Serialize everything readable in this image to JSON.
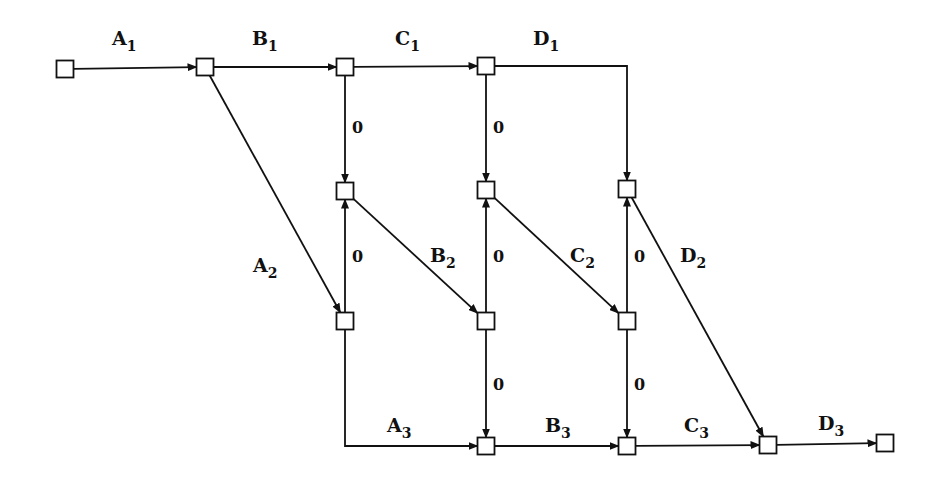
{
  "diagram": {
    "type": "activity-network",
    "node_size": 17,
    "stroke_color": "#111111",
    "background": "#ffffff",
    "nodes": [
      {
        "id": "n0",
        "x": 65,
        "y": 69
      },
      {
        "id": "n1",
        "x": 205,
        "y": 67
      },
      {
        "id": "n2",
        "x": 345,
        "y": 67
      },
      {
        "id": "n3",
        "x": 486,
        "y": 66
      },
      {
        "id": "m1",
        "x": 345,
        "y": 191
      },
      {
        "id": "m2",
        "x": 486,
        "y": 190
      },
      {
        "id": "m3",
        "x": 627,
        "y": 189
      },
      {
        "id": "l1",
        "x": 345,
        "y": 321
      },
      {
        "id": "l2",
        "x": 486,
        "y": 321
      },
      {
        "id": "l3",
        "x": 627,
        "y": 321
      },
      {
        "id": "b2",
        "x": 486,
        "y": 446
      },
      {
        "id": "b3",
        "x": 627,
        "y": 446
      },
      {
        "id": "b4",
        "x": 768,
        "y": 445
      },
      {
        "id": "b5",
        "x": 885,
        "y": 443
      }
    ],
    "edges": [
      {
        "from": "n0",
        "to": "n1",
        "label": "A",
        "sub": "1",
        "lx": 112,
        "ly": 45
      },
      {
        "from": "n1",
        "to": "n2",
        "label": "B",
        "sub": "1",
        "lx": 252,
        "ly": 45
      },
      {
        "from": "n2",
        "to": "n3",
        "label": "C",
        "sub": "1",
        "lx": 395,
        "ly": 45
      },
      {
        "from": "n3",
        "to": "m3",
        "label": "D",
        "sub": "1",
        "lx": 533,
        "ly": 45,
        "route": "elbow-right-down"
      },
      {
        "from": "n1",
        "to": "l1",
        "label": "A",
        "sub": "2",
        "lx": 253,
        "ly": 272
      },
      {
        "from": "m1",
        "to": "l2",
        "label": "B",
        "sub": "2",
        "lx": 430,
        "ly": 262
      },
      {
        "from": "m2",
        "to": "l3",
        "label": "C",
        "sub": "2",
        "lx": 570,
        "ly": 262
      },
      {
        "from": "m3",
        "to": "b4",
        "label": "D",
        "sub": "2",
        "lx": 680,
        "ly": 262
      },
      {
        "from": "l1",
        "to": "b2",
        "label": "A",
        "sub": "3",
        "lx": 387,
        "ly": 432,
        "route": "elbow-down-right"
      },
      {
        "from": "b2",
        "to": "b3",
        "label": "B",
        "sub": "3",
        "lx": 545,
        "ly": 432
      },
      {
        "from": "b3",
        "to": "b4",
        "label": "C",
        "sub": "3",
        "lx": 684,
        "ly": 432
      },
      {
        "from": "b4",
        "to": "b5",
        "label": "D",
        "sub": "3",
        "lx": 818,
        "ly": 430
      },
      {
        "from": "n2",
        "to": "m1",
        "label": "0",
        "dummy": true,
        "lx": 352,
        "ly": 133
      },
      {
        "from": "n3",
        "to": "m2",
        "label": "0",
        "dummy": true,
        "lx": 493,
        "ly": 133
      },
      {
        "from": "l1",
        "to": "m1",
        "label": "0",
        "dummy": true,
        "lx": 352,
        "ly": 262
      },
      {
        "from": "l2",
        "to": "m2",
        "label": "0",
        "dummy": true,
        "lx": 493,
        "ly": 262
      },
      {
        "from": "l3",
        "to": "m3",
        "label": "0",
        "dummy": true,
        "lx": 634,
        "ly": 262
      },
      {
        "from": "l2",
        "to": "b2",
        "label": "0",
        "dummy": true,
        "lx": 493,
        "ly": 390
      },
      {
        "from": "l3",
        "to": "b3",
        "label": "0",
        "dummy": true,
        "lx": 634,
        "ly": 390
      }
    ]
  }
}
